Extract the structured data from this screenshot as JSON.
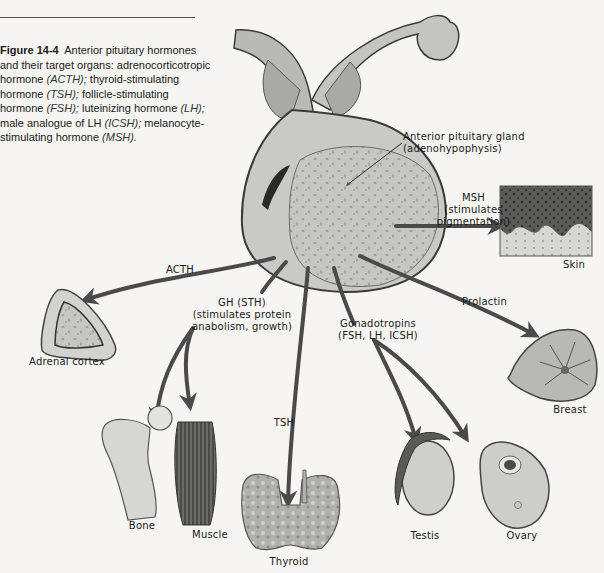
{
  "caption": {
    "figure_label": "Figure 14-4",
    "text_1": "Anterior pituitary hormones and their target organs: adrenocorticotropic hormone ",
    "acth": "(ACTH);",
    "text_2": " thyroid-stimulating hormone ",
    "tsh": "(TSH);",
    "text_3": " follicle-stimulating hormone ",
    "fsh": "(FSH);",
    "text_4": " luteinizing hormone ",
    "lh": "(LH);",
    "text_5": " male analogue of LH ",
    "icsh": "(ICSH);",
    "text_6": " melanocyte-stimulating hormone ",
    "msh": "(MSH)."
  },
  "gland": {
    "label_line1": "Anterior pituitary gland",
    "label_line2": "(adenohypophysis)"
  },
  "hormones": {
    "msh_line1": "MSH",
    "msh_line2": "(stimulates",
    "msh_line3": "pigmentation)",
    "acth": "ACTH",
    "gh_line1": "GH (STH)",
    "gh_line2": "(stimulates protein",
    "gh_line3": "anabolism, growth)",
    "gonadotropins_line1": "Gonadotropins",
    "gonadotropins_line2": "(FSH, LH, ICSH)",
    "prolactin": "Prolactin",
    "tsh": "TSH"
  },
  "organs": {
    "skin": "Skin",
    "adrenal_cortex": "Adrenal cortex",
    "breast": "Breast",
    "bone": "Bone",
    "muscle": "Muscle",
    "thyroid": "Thyroid",
    "testis": "Testis",
    "ovary": "Ovary"
  },
  "colors": {
    "arrow": "#4a4a4a",
    "tissue": "#c9c9c6",
    "outline": "#3a3a3a",
    "background": "#f6f5f3"
  }
}
